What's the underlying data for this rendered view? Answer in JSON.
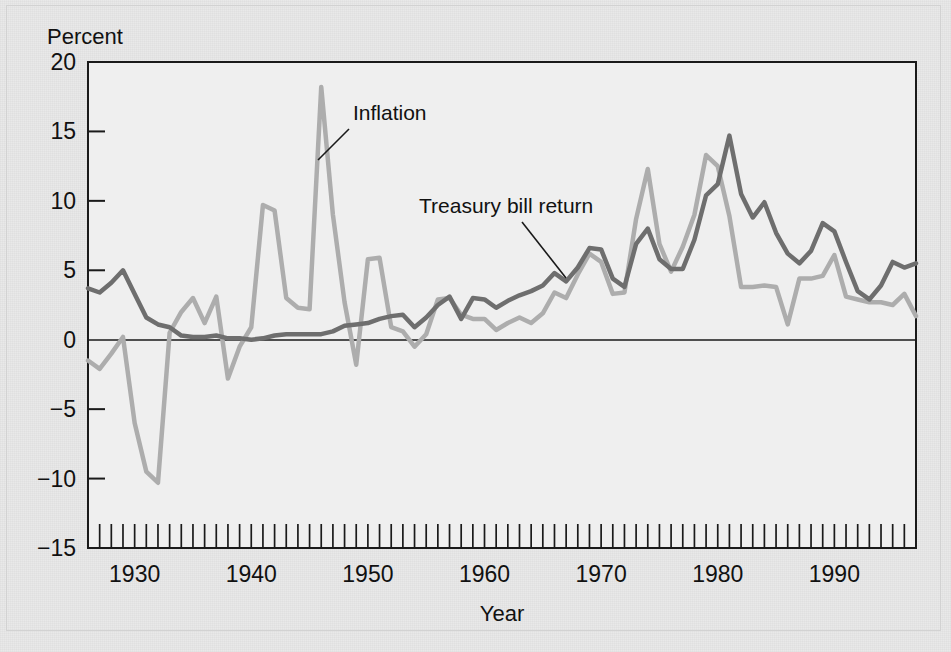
{
  "figure": {
    "background_color": "#e9e9e9",
    "plot_background_color": "#efefef",
    "frame_color": "#1a1a1a"
  },
  "chart_data": {
    "type": "line",
    "title": "",
    "subtitle": "",
    "xlabel": "Year",
    "ylabel": "Percent",
    "ylabel_position": "top-left",
    "xlim": [
      1926,
      1997
    ],
    "ylim": [
      -15,
      20
    ],
    "yticks": [
      -15,
      -10,
      -5,
      0,
      5,
      10,
      15,
      20
    ],
    "ytick_labels": [
      "−15",
      "−10",
      "−5",
      "0",
      "5",
      "10",
      "15",
      "20"
    ],
    "xticks": [
      1930,
      1940,
      1950,
      1960,
      1970,
      1980,
      1990
    ],
    "xtick_labels": [
      "1930",
      "1940",
      "1950",
      "1960",
      "1970",
      "1980",
      "1990"
    ],
    "minor_xticks_every": 1,
    "grid": false,
    "legend": "none",
    "annotations": [
      {
        "text": "Inflation",
        "label_x": 353,
        "label_y": 120,
        "leader_from_x": 349,
        "leader_from_y": 129,
        "leader_to_x": 318,
        "leader_to_y": 160,
        "series": "inflation"
      },
      {
        "text": "Treasury bill return",
        "label_x": 419,
        "label_y": 213,
        "leader_from_x": 522,
        "leader_from_y": 222,
        "leader_to_x": 566,
        "leader_to_y": 278,
        "series": "treasury_bill_return"
      }
    ],
    "zero_line": 0,
    "x": [
      1926,
      1927,
      1928,
      1929,
      1930,
      1931,
      1932,
      1933,
      1934,
      1935,
      1936,
      1937,
      1938,
      1939,
      1940,
      1941,
      1942,
      1943,
      1944,
      1945,
      1946,
      1947,
      1948,
      1949,
      1950,
      1951,
      1952,
      1953,
      1954,
      1955,
      1956,
      1957,
      1958,
      1959,
      1960,
      1961,
      1962,
      1963,
      1964,
      1965,
      1966,
      1967,
      1968,
      1969,
      1970,
      1971,
      1972,
      1973,
      1974,
      1975,
      1976,
      1977,
      1978,
      1979,
      1980,
      1981,
      1982,
      1983,
      1984,
      1985,
      1986,
      1987,
      1988,
      1989,
      1990,
      1991,
      1992,
      1993,
      1994,
      1995,
      1996,
      1997
    ],
    "series": [
      {
        "name": "Treasury bill return",
        "color": "#6e6e6e",
        "linewidth": 4.5,
        "values": [
          3.7,
          3.4,
          4.1,
          5.0,
          3.3,
          1.6,
          1.1,
          0.9,
          0.3,
          0.2,
          0.2,
          0.3,
          0.1,
          0.1,
          0.0,
          0.1,
          0.3,
          0.4,
          0.4,
          0.4,
          0.4,
          0.6,
          1.0,
          1.1,
          1.2,
          1.5,
          1.7,
          1.8,
          0.9,
          1.6,
          2.5,
          3.1,
          1.5,
          3.0,
          2.9,
          2.3,
          2.8,
          3.2,
          3.5,
          3.9,
          4.8,
          4.2,
          5.2,
          6.6,
          6.5,
          4.4,
          3.8,
          6.9,
          8.0,
          5.8,
          5.1,
          5.1,
          7.2,
          10.4,
          11.2,
          14.7,
          10.5,
          8.8,
          9.9,
          7.7,
          6.2,
          5.5,
          6.4,
          8.4,
          7.8,
          5.6,
          3.5,
          2.9,
          3.9,
          5.6,
          5.2,
          5.5
        ]
      },
      {
        "name": "Inflation",
        "color": "#adadad",
        "linewidth": 4.5,
        "values": [
          -1.5,
          -2.1,
          -1.0,
          0.2,
          -6.0,
          -9.5,
          -10.3,
          0.5,
          2.0,
          3.0,
          1.2,
          3.1,
          -2.8,
          -0.5,
          0.9,
          9.7,
          9.3,
          3.0,
          2.3,
          2.2,
          18.2,
          9.0,
          2.7,
          -1.8,
          5.8,
          5.9,
          0.9,
          0.6,
          -0.5,
          0.4,
          2.9,
          3.0,
          1.8,
          1.5,
          1.5,
          0.7,
          1.2,
          1.6,
          1.2,
          1.9,
          3.4,
          3.0,
          4.7,
          6.2,
          5.6,
          3.3,
          3.4,
          8.7,
          12.3,
          6.9,
          4.9,
          6.7,
          9.0,
          13.3,
          12.5,
          8.9,
          3.8,
          3.8,
          3.9,
          3.8,
          1.1,
          4.4,
          4.4,
          4.6,
          6.1,
          3.1,
          2.9,
          2.7,
          2.7,
          2.5,
          3.3,
          1.7
        ]
      }
    ]
  }
}
